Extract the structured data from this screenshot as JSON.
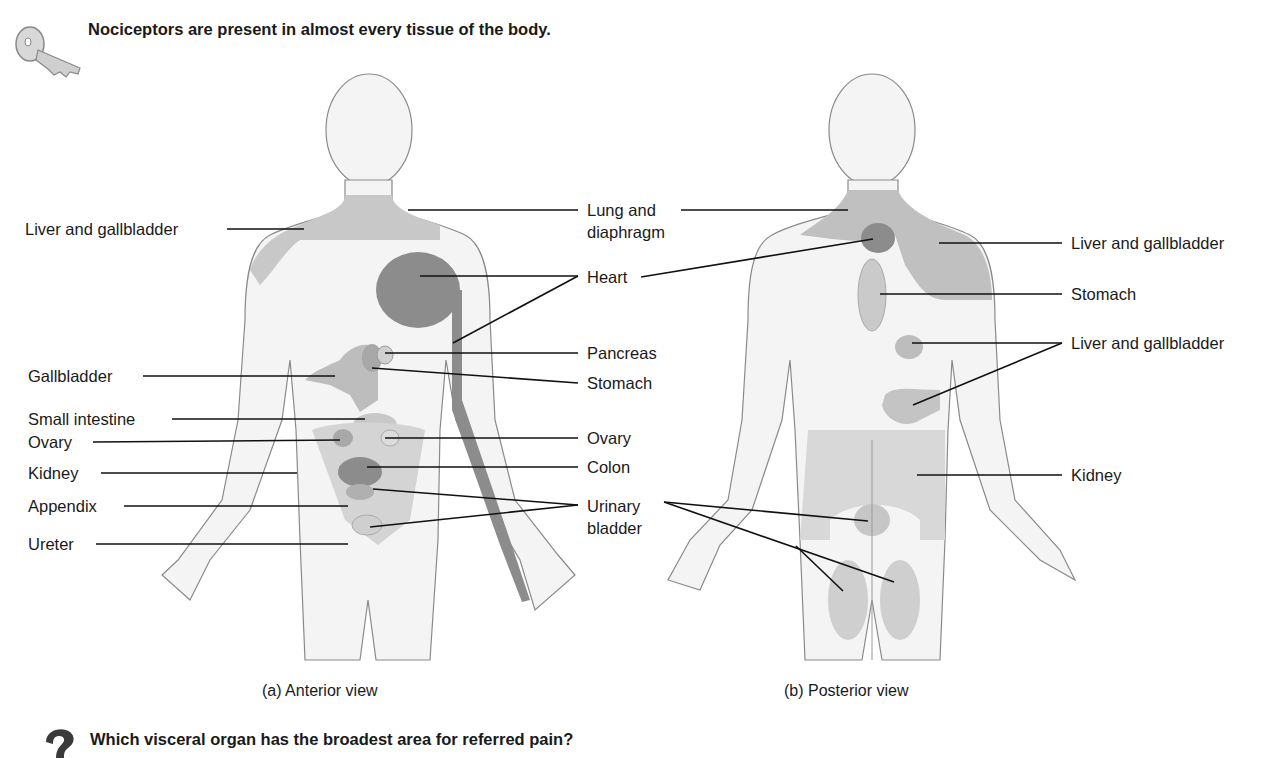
{
  "key_note": "Nociceptors are present in almost every tissue of the body.",
  "question": "Which visceral organ has the broadest area for referred pain?",
  "icons": {
    "key": "key-icon",
    "question": "question-mark-icon"
  },
  "colors": {
    "light_fill": "#d2d2d2",
    "mid_fill": "#bdbdbd",
    "dark_fill": "#8c8c8c",
    "outline": "#8a8a8a",
    "body": "#f4f4f4"
  },
  "anterior": {
    "caption": "(a) Anterior view",
    "left_labels": [
      "Liver and gallbladder",
      "Gallbladder",
      "Small intestine",
      "Ovary",
      "Kidney",
      "Appendix",
      "Ureter"
    ],
    "right_labels": [
      "Lung and",
      "diaphragm",
      "Heart",
      "Pancreas",
      "Stomach",
      "Ovary",
      "Colon",
      "Urinary",
      "bladder"
    ]
  },
  "posterior": {
    "caption": "(b) Posterior view",
    "right_labels": [
      "Liver and gallbladder",
      "Stomach",
      "Liver and gallbladder",
      "Kidney"
    ]
  }
}
